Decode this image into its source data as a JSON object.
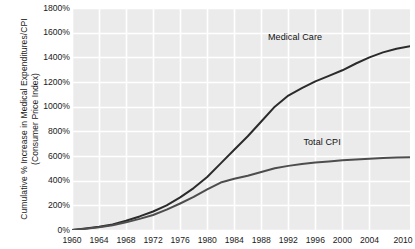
{
  "chart_data": {
    "type": "line",
    "title": "",
    "xlabel": "",
    "ylabel": "Cumulative % Increase in Medical Expenditures/CPI (Consumer Price Index)",
    "xlim": [
      1960,
      2010
    ],
    "ylim": [
      0,
      1800
    ],
    "grid": true,
    "legend_position": "inline-annotation",
    "ytick_labels": [
      "1800%",
      "1600%",
      "1400%",
      "1200%",
      "1000%",
      "800%",
      "600%",
      "400%",
      "200%",
      "0%"
    ],
    "ytick_values": [
      1800,
      1600,
      1400,
      1200,
      1000,
      800,
      600,
      400,
      200,
      0
    ],
    "xtick_labels": [
      "1960",
      "1964",
      "1968",
      "1972",
      "1976",
      "1980",
      "1984",
      "1988",
      "1992",
      "1996",
      "2000",
      "2004",
      "2010"
    ],
    "xtick_values": [
      1960,
      1964,
      1968,
      1972,
      1976,
      1980,
      1984,
      1988,
      1992,
      1996,
      2000,
      2004,
      2010
    ],
    "x": [
      1960,
      1962,
      1964,
      1966,
      1968,
      1970,
      1972,
      1974,
      1976,
      1978,
      1980,
      1982,
      1984,
      1986,
      1988,
      1990,
      1992,
      1994,
      1996,
      1998,
      2000,
      2002,
      2004,
      2006,
      2008,
      2010
    ],
    "series": [
      {
        "name": "Medical Care",
        "color": "#2b2b2b",
        "label_x": 1993,
        "label_y": 1560,
        "values": [
          0,
          12,
          26,
          45,
          75,
          110,
          150,
          200,
          265,
          340,
          430,
          540,
          650,
          760,
          880,
          1000,
          1090,
          1150,
          1205,
          1250,
          1295,
          1350,
          1400,
          1440,
          1470,
          1490
        ]
      },
      {
        "name": "Total CPI",
        "color": "#4d4d4d",
        "label_x": 1997,
        "label_y": 705,
        "values": [
          0,
          10,
          22,
          38,
          62,
          90,
          122,
          165,
          215,
          268,
          330,
          385,
          415,
          440,
          470,
          500,
          520,
          535,
          548,
          556,
          565,
          572,
          578,
          583,
          587,
          590
        ]
      }
    ],
    "annotations": [
      {
        "text": "Medical Care",
        "series": "Medical Care"
      },
      {
        "text": "Total CPI",
        "series": "Total CPI"
      }
    ],
    "colors": {
      "plot_background": "#ebebeb",
      "gridline": "#ffffff",
      "page_background": "#ffffff",
      "text": "#1a1a1a"
    }
  }
}
